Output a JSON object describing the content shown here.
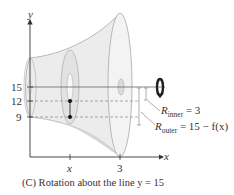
{
  "figure": {
    "caption": "(C) Rotation about the line y = 15",
    "axes": {
      "x_label": "x",
      "y_label": "y",
      "x_ticks": [
        "x",
        "3"
      ],
      "y_ticks": [
        "15",
        "12",
        "9"
      ]
    },
    "annotations": {
      "r_inner_symbol": "R",
      "r_inner_sub": "inner",
      "r_inner_value": " = 3",
      "r_outer_symbol": "R",
      "r_outer_sub": "outer",
      "r_outer_value": " = 15 − f(x)"
    },
    "axis_of_rotation": "y = 15",
    "colors": {
      "solid_fill": "#ebebeb",
      "solid_stroke": "#a9a9a9",
      "axis": "#333333",
      "dashed": "#777777",
      "point": "#111111"
    }
  }
}
